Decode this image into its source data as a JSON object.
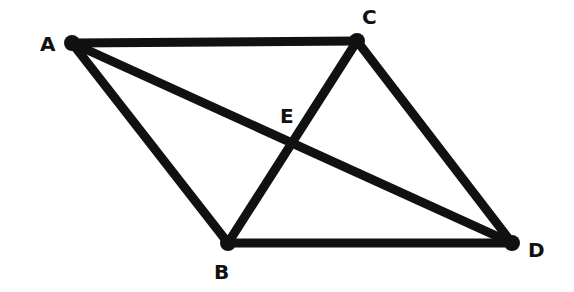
{
  "diagram": {
    "stroke_color": "#111111",
    "background": "#ffffff",
    "points": [
      {
        "id": "A",
        "label": "A",
        "x": 72,
        "y": 43,
        "lx": 40,
        "ly": 51
      },
      {
        "id": "C",
        "label": "C",
        "x": 357,
        "y": 41,
        "lx": 362,
        "ly": 24
      },
      {
        "id": "B",
        "label": "B",
        "x": 228,
        "y": 243,
        "lx": 214,
        "ly": 279
      },
      {
        "id": "D",
        "label": "D",
        "x": 512,
        "y": 243,
        "lx": 528,
        "ly": 257
      },
      {
        "id": "E",
        "label": "E",
        "x": 292,
        "y": 145,
        "lx": 280,
        "ly": 123
      }
    ],
    "segments": [
      [
        "A",
        "C"
      ],
      [
        "A",
        "B"
      ],
      [
        "A",
        "D"
      ],
      [
        "C",
        "B"
      ],
      [
        "C",
        "D"
      ],
      [
        "B",
        "D"
      ]
    ]
  }
}
